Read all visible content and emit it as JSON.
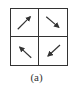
{
  "figure": {
    "caption": "(a)",
    "grid": {
      "rows": 2,
      "cols": 2,
      "cells": [
        {
          "position": "top-left",
          "arrow": "arrow-up-right-icon",
          "glyph": "↗",
          "x1": 7,
          "y1": 21,
          "x2": 21,
          "y2": 7
        },
        {
          "position": "top-right",
          "arrow": "arrow-down-right-icon",
          "glyph": "↘",
          "x1": 7,
          "y1": 8,
          "x2": 21,
          "y2": 20
        },
        {
          "position": "bottom-left",
          "arrow": "arrow-up-left-icon",
          "glyph": "↖",
          "x1": 21,
          "y1": 21,
          "x2": 8,
          "y2": 9
        },
        {
          "position": "bottom-right",
          "arrow": "arrow-down-left-icon",
          "glyph": "↙",
          "x1": 21,
          "y1": 8,
          "x2": 8,
          "y2": 20
        }
      ]
    },
    "colors": {
      "line": "#333333",
      "background": "#ffffff"
    }
  }
}
